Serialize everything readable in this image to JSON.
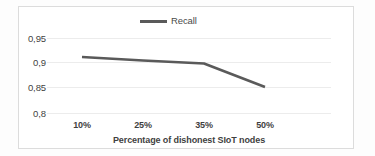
{
  "chart_data": {
    "type": "line",
    "title": "",
    "xlabel": "Percentage of dishonest SIoT nodes",
    "ylabel": "",
    "categories": [
      "10%",
      "25%",
      "35%",
      "50%"
    ],
    "series": [
      {
        "name": "Recall",
        "values": [
          0.912,
          0.905,
          0.899,
          0.852
        ],
        "color": "#5a5a5a"
      }
    ],
    "ylim": [
      0.8,
      0.95
    ],
    "yticks": [
      "0,95",
      "0,9",
      "0,85",
      "0,8"
    ],
    "ytick_values": [
      0.95,
      0.9,
      0.85,
      0.8
    ],
    "grid": true,
    "legend": {
      "position": "top-center",
      "entries": [
        "Recall"
      ]
    }
  },
  "legend": {
    "recall_label": "Recall",
    "swatch_name": "line-swatch"
  },
  "axes": {
    "y_tick_labels": [
      "0,95",
      "0,9",
      "0,85",
      "0,8"
    ],
    "x_tick_labels": [
      "10%",
      "25%",
      "35%",
      "50%"
    ],
    "x_title": "Percentage of dishonest SIoT nodes"
  },
  "colors": {
    "series_line": "#5a5a5a",
    "gridline": "#ececec",
    "frame": "#dcdcdc",
    "text": "#3f3f3f",
    "background": "#ffffff"
  }
}
